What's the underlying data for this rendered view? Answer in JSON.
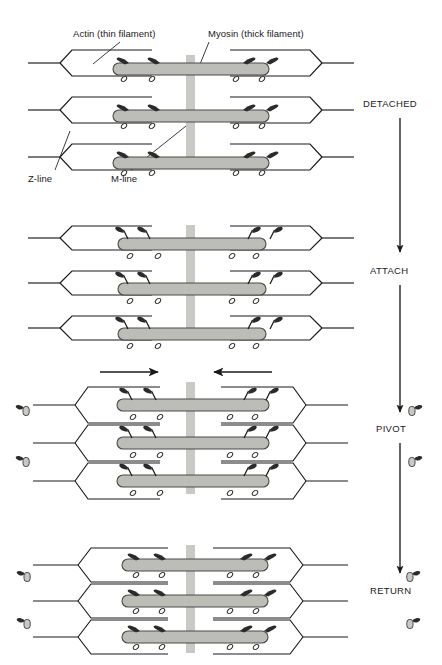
{
  "figure": {
    "annotations": {
      "actin": "Actin (thin filament)",
      "myosin": "Myosin (thick filament)",
      "zline": "Z-line",
      "mline": "M-line"
    },
    "stages": [
      {
        "id": "detached",
        "label": "DETACHED",
        "x": 386,
        "y": 105
      },
      {
        "id": "attach",
        "label": "ATTACH",
        "x": 386,
        "y": 272
      },
      {
        "id": "pivot",
        "label": "PIVOT",
        "x": 386,
        "y": 430
      },
      {
        "id": "return",
        "label": "RETURN",
        "x": 386,
        "y": 592
      }
    ],
    "colors": {
      "line": "#1a1a1a",
      "myosin_fill": "#bdbdb8",
      "myosin_stroke": "#4a4a48",
      "mline_fill": "#c9c9c6",
      "head_fill": "#2b2b2b",
      "background": "#ffffff"
    },
    "pivot_arrows": [
      {
        "id": "left-slide-arrow",
        "direction": "right"
      },
      {
        "id": "right-slide-arrow",
        "direction": "left"
      }
    ],
    "flow_arrows": [
      {
        "id": "detached-to-attach"
      },
      {
        "id": "attach-to-pivot"
      },
      {
        "id": "pivot-to-return"
      }
    ],
    "panels": [
      {
        "id": "panel-detached",
        "stage": "DETACHED",
        "filament_rows": 3
      },
      {
        "id": "panel-attach",
        "stage": "ATTACH",
        "filament_rows": 3
      },
      {
        "id": "panel-pivot",
        "stage": "PIVOT",
        "filament_rows": 3
      },
      {
        "id": "panel-return",
        "stage": "RETURN",
        "filament_rows": 3
      }
    ]
  }
}
